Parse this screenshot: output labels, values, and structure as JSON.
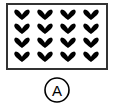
{
  "figure": {
    "frame": {
      "x": 7,
      "y": 4,
      "width": 100,
      "height": 65,
      "stroke": "#333333"
    },
    "grid": {
      "rows": 4,
      "cols": 4,
      "symbol": "heart-icon",
      "color": "#000000",
      "col_centers": [
        22,
        45,
        68,
        91
      ],
      "row_centers": [
        15,
        29,
        43,
        57
      ]
    },
    "option_label": "A",
    "label_circle": {
      "cx": 57,
      "cy": 90,
      "r": 12
    }
  }
}
